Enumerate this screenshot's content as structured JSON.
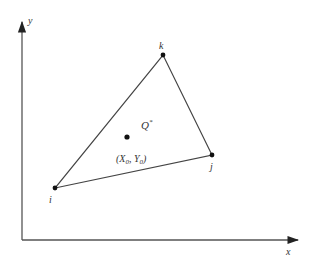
{
  "diagram": {
    "type": "triangle-element",
    "axes": {
      "x_label": "x",
      "y_label": "y",
      "origin": [
        22,
        240
      ],
      "x_end": [
        298,
        240
      ],
      "y_end": [
        22,
        22
      ]
    },
    "vertices": [
      {
        "id": "i",
        "label": "i",
        "pos": [
          55,
          188
        ],
        "label_pos": [
          50,
          203
        ]
      },
      {
        "id": "j",
        "label": "j",
        "pos": [
          212,
          155
        ],
        "label_pos": [
          211,
          170
        ]
      },
      {
        "id": "k",
        "label": "k",
        "pos": [
          163,
          55
        ],
        "label_pos": [
          159,
          48
        ]
      }
    ],
    "interior_point": {
      "pos": [
        127,
        137
      ],
      "name_label": "Q",
      "name_superscript": "*",
      "coord_label": "(X",
      "coord_x_sub": "0",
      "coord_sep": ", Y",
      "coord_y_sub": "0",
      "coord_close": ")"
    },
    "colors": {
      "line": "#444444",
      "point": "#111111",
      "text": "#333333",
      "background": "#ffffff"
    }
  }
}
